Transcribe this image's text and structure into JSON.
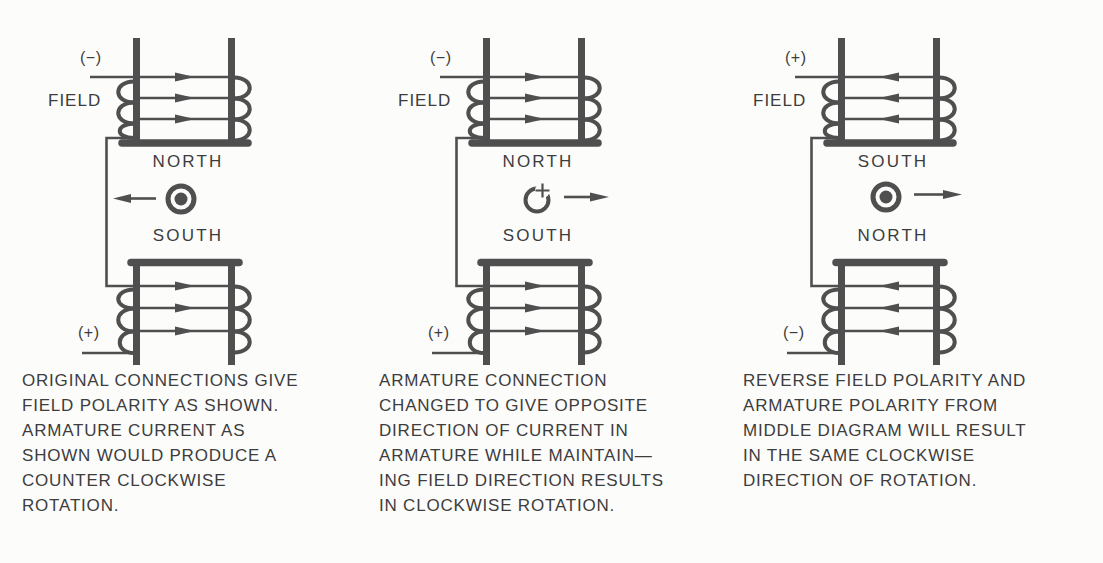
{
  "panels": [
    {
      "polarity_top": "(−)",
      "field_label": "FIELD",
      "pole_top": "NORTH",
      "pole_bottom": "SOUTH",
      "polarity_bottom": "(+)",
      "field_current_direction": "right",
      "armature_symbol": "dot-current-out-of-page",
      "armature_motion": "left",
      "caption": "ORIGINAL CONNECTIONS GIVE\nFIELD POLARITY AS SHOWN.\nARMATURE CURRENT AS\nSHOWN WOULD PRODUCE A\nCOUNTER CLOCKWISE\nROTATION."
    },
    {
      "polarity_top": "(−)",
      "field_label": "FIELD",
      "pole_top": "NORTH",
      "pole_bottom": "SOUTH",
      "polarity_bottom": "(+)",
      "field_current_direction": "right",
      "armature_symbol": "cross-current-into-page",
      "armature_motion": "right",
      "caption": "ARMATURE CONNECTION\nCHANGED TO GIVE OPPOSITE\nDIRECTION OF CURRENT IN\nARMATURE WHILE MAINTAIN—\nING FIELD DIRECTION RESULTS\nIN CLOCKWISE ROTATION."
    },
    {
      "polarity_top": "(+)",
      "field_label": "FIELD",
      "pole_top": "SOUTH",
      "pole_bottom": "NORTH",
      "polarity_bottom": "(−)",
      "field_current_direction": "left",
      "armature_symbol": "dot-current-out-of-page",
      "armature_motion": "right",
      "caption": "REVERSE FIELD POLARITY AND\nARMATURE POLARITY FROM\nMIDDLE DIAGRAM WILL RESULT\nIN THE SAME CLOCKWISE\nDIRECTION OF ROTATION."
    }
  ],
  "colors": {
    "ink": "#4f4f4f",
    "text": "#3d3d3d",
    "paper": "#fcfcfb"
  }
}
